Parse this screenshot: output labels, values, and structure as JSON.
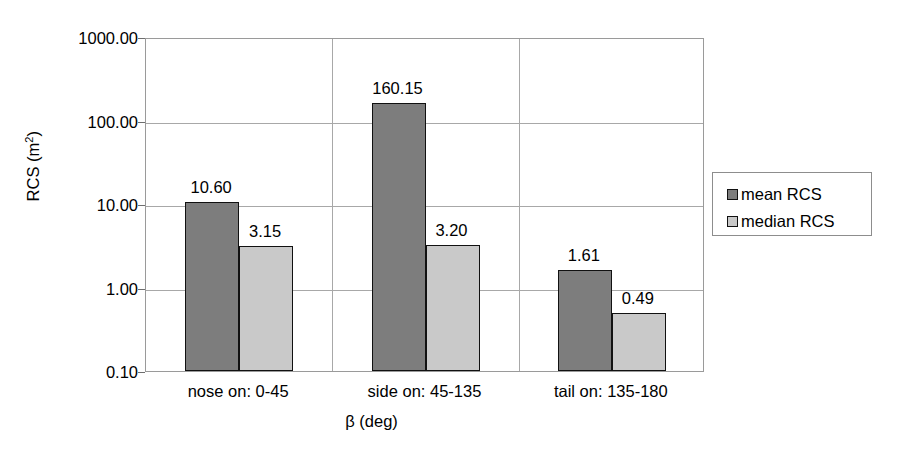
{
  "chart_data": {
    "type": "bar",
    "title": "",
    "xlabel": "β (deg)",
    "ylabel": "RCS (m2)",
    "ylabel_base": "RCS (m",
    "ylabel_sup": "2",
    "ylabel_close": ")",
    "yscale": "log",
    "ylim": [
      0.1,
      1000.0
    ],
    "ytick_labels": [
      "1000.00",
      "100.00",
      "10.00",
      "1.00",
      "0.10"
    ],
    "ytick_values": [
      1000,
      100,
      10,
      1,
      0.1
    ],
    "grid": "horizontal-and-vertical",
    "legend_position": "right",
    "categories": [
      "nose on:  0-45",
      "side on: 45-135",
      "tail on: 135-180"
    ],
    "series": [
      {
        "name": "mean RCS",
        "color": "#7d7d7d",
        "values": [
          10.6,
          160.15,
          1.61
        ],
        "labels": [
          "10.60",
          "160.15",
          "1.61"
        ]
      },
      {
        "name": "median RCS",
        "color": "#c9c9c9",
        "values": [
          3.15,
          3.2,
          0.49
        ],
        "labels": [
          "3.15",
          "3.20",
          "0.49"
        ]
      }
    ]
  }
}
